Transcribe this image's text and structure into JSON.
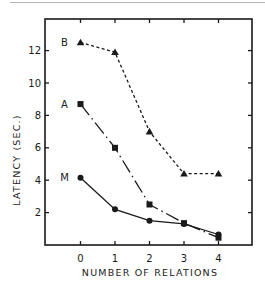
{
  "chart_data": {
    "type": "line",
    "title": "",
    "xlabel": "NUMBER OF RELATIONS",
    "ylabel": "LATENCY (SEC.)",
    "x": [
      0,
      1,
      2,
      3,
      4
    ],
    "x_tick_labels": [
      "0",
      "1",
      "2",
      "3",
      "4"
    ],
    "y_tick_labels": [
      "2",
      "4",
      "6",
      "8",
      "10",
      "12"
    ],
    "y_ticks": [
      2,
      4,
      6,
      8,
      10,
      12
    ],
    "xlim": [
      -1,
      5
    ],
    "ylim": [
      0,
      14
    ],
    "grid": false,
    "legend": "inline labels at left of each series",
    "series": [
      {
        "name": "B",
        "marker": "triangle",
        "line_style": "dashed",
        "values": [
          12.5,
          11.9,
          7.0,
          4.4,
          4.4
        ]
      },
      {
        "name": "A",
        "marker": "square",
        "line_style": "dash-dot",
        "values": [
          8.7,
          6.0,
          2.5,
          1.35,
          0.45
        ]
      },
      {
        "name": "M",
        "marker": "circle",
        "line_style": "solid",
        "values": [
          4.15,
          2.2,
          1.5,
          1.3,
          0.65
        ]
      }
    ]
  },
  "colors": {
    "ink": "#1a1a1a",
    "rule": "#b5b5b5",
    "background": "#ffffff"
  }
}
